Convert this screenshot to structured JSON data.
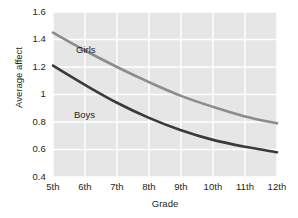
{
  "chart_data": {
    "type": "line",
    "title": "",
    "xlabel": "Grade",
    "ylabel": "Average affect",
    "categories": [
      "5th",
      "6th",
      "7th",
      "8th",
      "9th",
      "10th",
      "11th",
      "12th"
    ],
    "ylim": [
      0.4,
      1.6
    ],
    "yticks": [
      "1.6",
      "1.4",
      "1.2",
      "1",
      "0.8",
      "0.6",
      "0.4"
    ],
    "ytick_values": [
      1.6,
      1.4,
      1.2,
      1.0,
      0.8,
      0.6,
      0.4
    ],
    "grid": true,
    "legend_position": "inline-labels",
    "plot_background": "#e6e6e6",
    "gridline_color": "#ffffff",
    "series": [
      {
        "name": "Girls",
        "color": "#8c8c8c",
        "values": [
          1.45,
          1.32,
          1.2,
          1.09,
          0.99,
          0.91,
          0.84,
          0.79
        ]
      },
      {
        "name": "Boys",
        "color": "#3a3a3a",
        "values": [
          1.21,
          1.07,
          0.94,
          0.83,
          0.74,
          0.67,
          0.62,
          0.58
        ]
      }
    ],
    "annotations": [
      {
        "text": "Girls",
        "x": 76,
        "y": 44
      },
      {
        "text": "Boys",
        "x": 74,
        "y": 109
      }
    ]
  }
}
